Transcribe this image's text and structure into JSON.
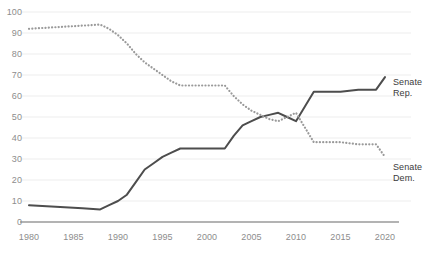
{
  "chart_data": {
    "type": "line",
    "title": "",
    "subtitle": "",
    "xlabel": "",
    "ylabel": "",
    "xlim": [
      1980,
      2020
    ],
    "ylim": [
      0,
      100
    ],
    "grid": true,
    "grid_axis": "y",
    "legend_position": "right-inline",
    "x_ticks": [
      1980,
      1985,
      1990,
      1995,
      2000,
      2005,
      2010,
      2015,
      2020
    ],
    "x_tick_labels": [
      "1980",
      "1985",
      "1990",
      "1995",
      "2000",
      "2005",
      "2010",
      "2015",
      "2020"
    ],
    "y_ticks": [
      0,
      10,
      20,
      30,
      40,
      50,
      60,
      70,
      80,
      90,
      100
    ],
    "y_tick_labels": [
      "0",
      "10",
      "20",
      "30",
      "40",
      "50",
      "60",
      "70",
      "80",
      "90",
      "100"
    ],
    "series": [
      {
        "name": "Senate Rep.",
        "label_line1": "Senate",
        "label_line2": "Rep.",
        "style": "solid",
        "color": "#4d4d4d",
        "width": 2.0,
        "points": [
          [
            1980,
            8
          ],
          [
            1982,
            7.5
          ],
          [
            1984,
            7
          ],
          [
            1986,
            6.5
          ],
          [
            1988,
            6
          ],
          [
            1989,
            8
          ],
          [
            1990,
            10
          ],
          [
            1991,
            13
          ],
          [
            1992,
            19
          ],
          [
            1993,
            25
          ],
          [
            1994,
            28
          ],
          [
            1995,
            31
          ],
          [
            1996,
            33
          ],
          [
            1997,
            35
          ],
          [
            1998,
            35
          ],
          [
            1999,
            35
          ],
          [
            2000,
            35
          ],
          [
            2001,
            35
          ],
          [
            2002,
            35
          ],
          [
            2003,
            41
          ],
          [
            2004,
            46
          ],
          [
            2005,
            48
          ],
          [
            2006,
            50
          ],
          [
            2007,
            51
          ],
          [
            2008,
            52
          ],
          [
            2009,
            50
          ],
          [
            2010,
            48
          ],
          [
            2011,
            55
          ],
          [
            2012,
            62
          ],
          [
            2013,
            62
          ],
          [
            2014,
            62
          ],
          [
            2015,
            62
          ],
          [
            2016,
            62.5
          ],
          [
            2017,
            63
          ],
          [
            2018,
            63
          ],
          [
            2019,
            63
          ],
          [
            2020,
            69
          ]
        ]
      },
      {
        "name": "Senate Dem.",
        "label_line1": "Senate",
        "label_line2": "Dem.",
        "style": "dotted",
        "color": "#9a9a9a",
        "width": 2.2,
        "points": [
          [
            1980,
            92
          ],
          [
            1982,
            92.5
          ],
          [
            1984,
            93
          ],
          [
            1986,
            93.5
          ],
          [
            1988,
            94
          ],
          [
            1989,
            92
          ],
          [
            1990,
            89
          ],
          [
            1991,
            85
          ],
          [
            1992,
            80
          ],
          [
            1993,
            76
          ],
          [
            1994,
            73
          ],
          [
            1995,
            70
          ],
          [
            1996,
            67
          ],
          [
            1997,
            65
          ],
          [
            1998,
            65
          ],
          [
            1999,
            65
          ],
          [
            2000,
            65
          ],
          [
            2001,
            65
          ],
          [
            2002,
            65
          ],
          [
            2003,
            60
          ],
          [
            2004,
            56
          ],
          [
            2005,
            53
          ],
          [
            2006,
            51
          ],
          [
            2007,
            49
          ],
          [
            2008,
            48
          ],
          [
            2009,
            50
          ],
          [
            2010,
            52
          ],
          [
            2011,
            45
          ],
          [
            2012,
            38
          ],
          [
            2013,
            38
          ],
          [
            2014,
            38
          ],
          [
            2015,
            38
          ],
          [
            2016,
            37.5
          ],
          [
            2017,
            37
          ],
          [
            2018,
            37
          ],
          [
            2019,
            37
          ],
          [
            2020,
            31
          ]
        ]
      }
    ],
    "colors": {
      "republican_line": "#4d4d4d",
      "democrat_line": "#9a9a9a",
      "gridline": "#ededed",
      "axis_line": "#9a9a9a",
      "tick_text": "#8d8d8d",
      "label_text": "#3b3b3b",
      "background": "#ffffff"
    }
  }
}
